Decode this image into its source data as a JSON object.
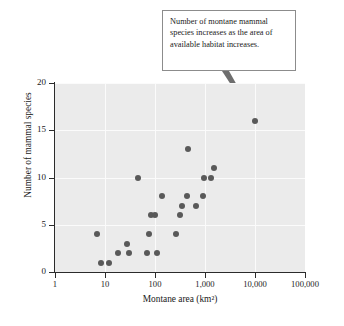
{
  "annotation": {
    "text": "Number of montane mammal species increases as the area of available habitat increases.",
    "target_point": {
      "x": 10000,
      "y": 16
    }
  },
  "chart_data": {
    "type": "scatter",
    "title": "",
    "xlabel": "Montane area (km²)",
    "ylabel": "Number of mammal species",
    "xscale": "log",
    "yscale": "linear",
    "xlim": [
      1,
      100000
    ],
    "ylim": [
      0,
      20
    ],
    "xticks": [
      1,
      10,
      100,
      1000,
      10000,
      100000
    ],
    "xticklabels": [
      "1",
      "10",
      "100",
      "1,000",
      "10,000",
      "100,000"
    ],
    "yticks": [
      0,
      5,
      10,
      15,
      20
    ],
    "yticklabels": [
      "0",
      "5",
      "10",
      "15",
      "20"
    ],
    "grid": true,
    "legend": false,
    "marker_color": "#595959",
    "plot_background": "#ebebeb",
    "points": [
      {
        "x": 7,
        "y": 4
      },
      {
        "x": 8.5,
        "y": 1
      },
      {
        "x": 12,
        "y": 1
      },
      {
        "x": 18,
        "y": 2
      },
      {
        "x": 27,
        "y": 3
      },
      {
        "x": 30,
        "y": 2
      },
      {
        "x": 45,
        "y": 10
      },
      {
        "x": 70,
        "y": 2
      },
      {
        "x": 75,
        "y": 4
      },
      {
        "x": 85,
        "y": 6
      },
      {
        "x": 100,
        "y": 6
      },
      {
        "x": 110,
        "y": 2
      },
      {
        "x": 140,
        "y": 8
      },
      {
        "x": 260,
        "y": 4
      },
      {
        "x": 320,
        "y": 6
      },
      {
        "x": 350,
        "y": 7
      },
      {
        "x": 430,
        "y": 8
      },
      {
        "x": 460,
        "y": 13
      },
      {
        "x": 650,
        "y": 7
      },
      {
        "x": 900,
        "y": 8
      },
      {
        "x": 950,
        "y": 10
      },
      {
        "x": 1300,
        "y": 10
      },
      {
        "x": 1500,
        "y": 11
      },
      {
        "x": 10000,
        "y": 16
      }
    ]
  }
}
